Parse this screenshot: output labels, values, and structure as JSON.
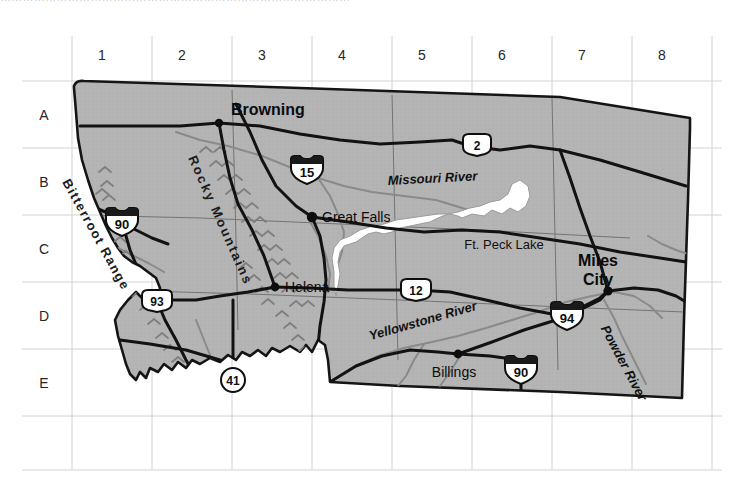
{
  "page": {
    "width": 742,
    "height": 488,
    "background": "#ffffff",
    "clipped_top_text": "…………………………………………………………………………………"
  },
  "map": {
    "title": "Montana reference map",
    "land_fill": "#b3b3b3",
    "land_outline": "#111111",
    "water_color": "#808080",
    "lake_fill": "#ffffff",
    "road_color": "#111111",
    "grid_color": "#cfcfcf",
    "grid": {
      "columns": [
        "1",
        "2",
        "3",
        "4",
        "5",
        "6",
        "7",
        "8"
      ],
      "rows": [
        "A",
        "B",
        "C",
        "D",
        "E"
      ],
      "x_lines": [
        72,
        152,
        232,
        312,
        392,
        472,
        552,
        632,
        712
      ],
      "y_lines": [
        81,
        148,
        215,
        282,
        349,
        416,
        470
      ],
      "column_label_y": 55,
      "row_label_x": 40
    },
    "cities": [
      {
        "name": "Browning",
        "x": 219,
        "y": 123,
        "label_dx": 12,
        "label_dy": 5,
        "anchor": "start",
        "font_size": 15,
        "bold": true
      },
      {
        "name": "Great Falls",
        "x": 312,
        "y": 217,
        "label_dx": 10,
        "label_dy": 5,
        "anchor": "start",
        "font_size": 13,
        "bold": false
      },
      {
        "name": "Helena",
        "x": 275,
        "y": 287,
        "label_dx": 10,
        "label_dy": 5,
        "anchor": "start",
        "font_size": 13,
        "bold": false
      },
      {
        "name": "Billings",
        "x": 458,
        "y": 354,
        "label_dx": -4,
        "label_dy": 22,
        "anchor": "middle",
        "font_size": 13,
        "bold": false
      },
      {
        "name": "Miles City",
        "x": 608,
        "y": 291,
        "label_dx": -10,
        "label_dy": -32,
        "anchor": "middle",
        "font_size": 15,
        "bold": true
      }
    ],
    "water_labels": [
      {
        "name": "Missouri River",
        "x": 388,
        "y": 185,
        "rotate": -3,
        "font_size": 13,
        "italic": true
      },
      {
        "name": "Ft. Peck Lake",
        "x": 504,
        "y": 249,
        "rotate": 0,
        "font_size": 13,
        "italic": false
      },
      {
        "name": "Yellowstone River",
        "x": 424,
        "y": 325,
        "rotate": -16,
        "font_size": 13,
        "italic": true
      },
      {
        "name": "Powder River",
        "x": 620,
        "y": 365,
        "rotate": 62,
        "font_size": 13,
        "italic": true
      }
    ],
    "terrain_labels": [
      {
        "name": "Rocky Mountains",
        "x": 188,
        "y": 158,
        "rotate": 66,
        "font_size": 13,
        "letter_spacing": 2.2
      },
      {
        "name": "Bitterroot Range",
        "x": 62,
        "y": 182,
        "rotate": 61,
        "font_size": 13,
        "letter_spacing": 1.4
      }
    ],
    "route_shields": [
      {
        "number": "15",
        "type": "interstate",
        "x": 307,
        "y": 170
      },
      {
        "number": "90",
        "type": "interstate",
        "x": 122,
        "y": 222
      },
      {
        "number": "94",
        "type": "interstate",
        "x": 567,
        "y": 316
      },
      {
        "number": "90",
        "type": "interstate",
        "x": 521,
        "y": 370
      },
      {
        "number": "2",
        "type": "us",
        "x": 477,
        "y": 145
      },
      {
        "number": "12",
        "type": "us",
        "x": 416,
        "y": 290
      },
      {
        "number": "93",
        "type": "us",
        "x": 157,
        "y": 301
      },
      {
        "number": "41",
        "type": "state",
        "x": 233,
        "y": 380
      }
    ]
  }
}
